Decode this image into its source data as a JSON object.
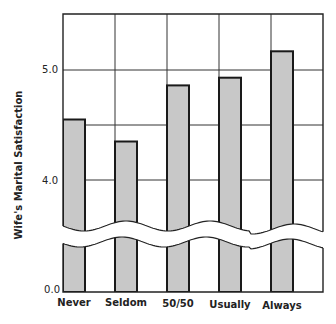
{
  "chart_data": {
    "type": "bar",
    "title": "",
    "xlabel": "",
    "ylabel": "Wife's Marital Satisfaction",
    "categories": [
      "Never",
      "Seldom",
      "50/50",
      "Usually",
      "Always"
    ],
    "values": [
      4.55,
      4.35,
      4.86,
      4.93,
      5.17
    ],
    "yticks": [
      {
        "label": "0.0",
        "value": 0.0
      },
      {
        "label": "4.0",
        "value": 4.0
      },
      {
        "label": "5.0",
        "value": 5.0
      }
    ],
    "ylim": [
      0,
      5.5
    ],
    "axis_break": {
      "between": [
        0.0,
        3.6
      ]
    },
    "grid": true,
    "legend": null,
    "bar_color": "#c8c8c8",
    "edge_color": "#1a1a1a"
  },
  "labels": {
    "ylabel": "Wife's Marital Satisfaction",
    "tick_0": "0.0",
    "tick_4": "4.0",
    "tick_5": "5.0",
    "cat_0": "Never",
    "cat_1": "Seldom",
    "cat_2": "50/50",
    "cat_3": "Usually",
    "cat_4": "Always"
  }
}
